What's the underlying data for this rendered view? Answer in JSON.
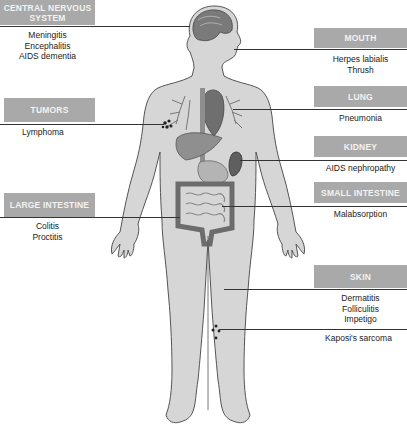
{
  "diagram": {
    "type": "anatomical-infection-map",
    "colors": {
      "label_box": "#a9a9a9",
      "label_text": "#f2f2f2",
      "body_fill": "#d6d6d6",
      "body_outline": "#555555",
      "organ_fill": "#8a8a8a",
      "leader_line": "#333333"
    },
    "regions": [
      {
        "id": "cns",
        "label": "CENTRAL NERVOUS SYSTEM",
        "label_line1": "CENTRAL NERVOUS",
        "label_line2": "SYSTEM",
        "side": "left",
        "conditions": [
          "Meningitis",
          "Encephalitis",
          "AIDS dementia"
        ]
      },
      {
        "id": "tumors",
        "label": "TUMORS",
        "side": "left",
        "conditions": [
          "Lymphoma"
        ]
      },
      {
        "id": "large-intestine",
        "label": "LARGE INTESTINE",
        "side": "left",
        "conditions": [
          "Colitis",
          "Proctitis"
        ]
      },
      {
        "id": "mouth",
        "label": "MOUTH",
        "side": "right",
        "conditions": [
          "Herpes labialis",
          "Thrush"
        ]
      },
      {
        "id": "lung",
        "label": "LUNG",
        "side": "right",
        "conditions": [
          "Pneumonia"
        ]
      },
      {
        "id": "kidney",
        "label": "KIDNEY",
        "side": "right",
        "conditions": [
          "AIDS nephropathy"
        ]
      },
      {
        "id": "small-intestine",
        "label": "SMALL INTESTINE",
        "side": "right",
        "conditions": [
          "Malabsorption"
        ]
      },
      {
        "id": "skin",
        "label": "SKIN",
        "side": "right",
        "conditions": [
          "Dermatitis",
          "Folliculitis",
          "Impetigo",
          "Kaposi's sarcoma"
        ]
      }
    ]
  }
}
